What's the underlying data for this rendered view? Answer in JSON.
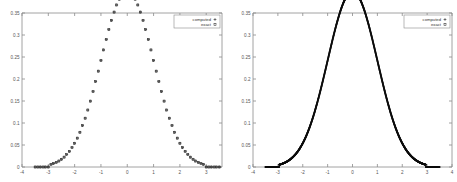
{
  "figure": {
    "panel_count": 2,
    "background": "#ffffff",
    "axis_color": "#8a8a8a",
    "data_color": "#1a1a1a"
  },
  "chart_data": [
    {
      "type": "scatter",
      "panel": "left",
      "title": "",
      "xlabel": "",
      "ylabel": "",
      "xlim": [
        -4,
        3.6
      ],
      "ylim": [
        0,
        0.35
      ],
      "grid": false,
      "legend_position": "top-right",
      "xticks": [
        -4,
        -3,
        -2,
        -1,
        0,
        1,
        2,
        3
      ],
      "xticklabels": [
        "-4",
        "-3",
        "-2",
        "-1",
        "0",
        "1",
        "2",
        "3"
      ],
      "yticks": [
        0,
        0.05,
        0.1,
        0.15,
        0.2,
        0.25,
        0.3,
        0.35
      ],
      "yticklabels": [
        "0",
        "0.05",
        "0.1",
        "0.15",
        "0.2",
        "0.25",
        "0.3",
        "0.35"
      ],
      "series": [
        {
          "name": "computed",
          "marker": "plus",
          "x": [
            -3.5,
            -3.4,
            -3.3,
            -3.2,
            -3.1,
            -3.0,
            -2.9,
            -2.8,
            -2.7,
            -2.6,
            -2.5,
            -2.4,
            -2.3,
            -2.2,
            -2.1,
            -2.0,
            -1.9,
            -1.8,
            -1.7,
            -1.6,
            -1.5,
            -1.4,
            -1.3,
            -1.2,
            -1.1,
            -1.0,
            -0.9,
            -0.8,
            -0.7,
            -0.6,
            -0.5,
            -0.4,
            -0.3,
            -0.2,
            -0.1,
            0.0,
            0.1,
            0.2,
            0.3,
            0.4,
            0.5,
            0.6,
            0.7,
            0.8,
            0.9,
            1.0,
            1.1,
            1.2,
            1.3,
            1.4,
            1.5,
            1.6,
            1.7,
            1.8,
            1.9,
            2.0,
            2.1,
            2.2,
            2.3,
            2.4,
            2.5,
            2.6,
            2.7,
            2.8,
            2.9,
            3.0,
            3.1,
            3.2,
            3.3,
            3.4,
            3.5
          ],
          "y": [
            0.0,
            0.0,
            0.0,
            0.0,
            0.0,
            0.0,
            0.0059,
            0.0164,
            0.0309,
            0.0486,
            0.0691,
            0.0918,
            0.116,
            0.1413,
            0.1669,
            0.1924,
            0.2171,
            0.2406,
            0.2625,
            0.2822,
            0.2995,
            0.3141,
            0.3257,
            0.3342,
            0.3394,
            0.3413,
            0.34,
            0.3355,
            0.328,
            0.3178,
            0.305,
            0.29,
            0.2732,
            0.255,
            0.2358,
            0.2162,
            0.2358,
            0.255,
            0.2732,
            0.29,
            0.305,
            0.3178,
            0.328,
            0.3355,
            0.34,
            0.3413,
            0.3394,
            0.3342,
            0.3257,
            0.3141,
            0.2995,
            0.2822,
            0.2625,
            0.2406,
            0.2171,
            0.1924,
            0.1669,
            0.1413,
            0.116,
            0.0918,
            0.0691,
            0.0486,
            0.0309,
            0.0164,
            0.0059,
            0.0,
            0.0,
            0.0,
            0.0,
            0.0,
            0.0
          ]
        },
        {
          "name": "exact",
          "marker": "square",
          "note": "coincides with computed series"
        }
      ]
    },
    {
      "type": "scatter",
      "panel": "right",
      "title": "",
      "xlabel": "",
      "ylabel": "",
      "xlim": [
        -4,
        4
      ],
      "ylim": [
        0,
        0.35
      ],
      "grid": false,
      "legend_position": "top-right",
      "xticks": [
        -4,
        -3,
        -2,
        -1,
        0,
        1,
        2,
        3,
        4
      ],
      "xticklabels": [
        "-4",
        "-3",
        "-2",
        "-1",
        "0",
        "1",
        "2",
        "3",
        "4"
      ],
      "yticks": [
        0,
        0.05,
        0.1,
        0.15,
        0.2,
        0.25,
        0.3,
        0.35
      ],
      "yticklabels": [
        "0",
        "0.05",
        "0.1",
        "0.15",
        "0.2",
        "0.25",
        "0.3",
        "0.35"
      ],
      "sampling": "dense",
      "series": [
        {
          "name": "computed",
          "marker": "plus",
          "description": "densely sampled gaussian, peak 0.3413 at x=0, zero outside +/-2.95"
        },
        {
          "name": "exact",
          "marker": "square",
          "note": "coincides with computed series"
        }
      ]
    }
  ],
  "legend": {
    "entries": [
      {
        "label": "computed",
        "marker": "plus"
      },
      {
        "label": "exact",
        "marker": "square"
      }
    ]
  }
}
